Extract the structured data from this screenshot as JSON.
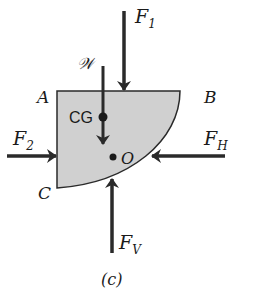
{
  "figure": {
    "caption": "(c)",
    "body": {
      "fill": "#d0d0d0",
      "stroke": "#2a2a2a",
      "corners": {
        "A": "A",
        "B": "B",
        "C": "C"
      }
    },
    "points": {
      "cg_label": "CG",
      "o_label": "O"
    },
    "forces": {
      "F1": {
        "main": "F",
        "sub": "1"
      },
      "F2": {
        "main": "F",
        "sub": "2"
      },
      "FH": {
        "main": "F",
        "sub": "H"
      },
      "FV": {
        "main": "F",
        "sub": "V"
      },
      "W": {
        "main": "𝒲"
      }
    },
    "colors": {
      "arrow": "#2a2a2a",
      "ink": "#1a1a1a"
    }
  }
}
